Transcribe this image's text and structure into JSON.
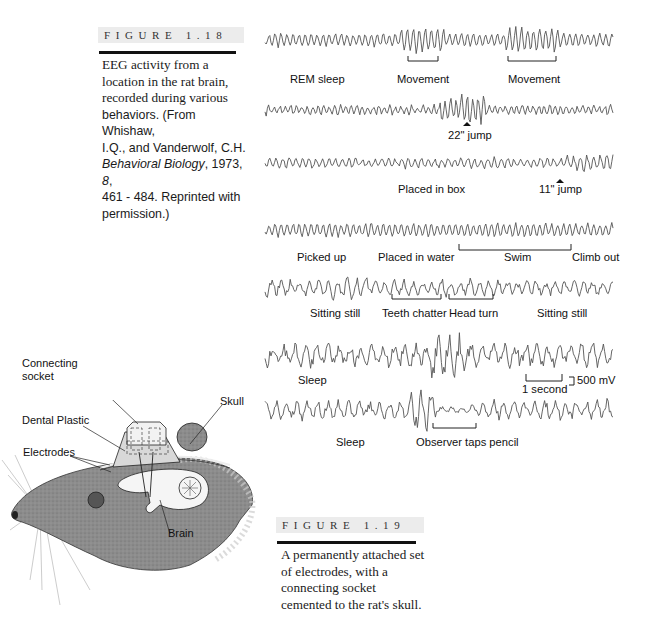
{
  "figure_1_18": {
    "label": "FIGURE 1.18",
    "caption_lines": [
      "EEG activity from a",
      "location in the rat brain,",
      "recorded during various"
    ],
    "caption_sans_1": "behaviors. (From Whishaw,",
    "caption_sans_2": "I.Q., and Vanderwolf, C.H.",
    "caption_italic_journal": "Behavioral Biology",
    "caption_after_journal": ", 1973, ",
    "caption_volume": "8",
    "caption_after_volume": ",",
    "caption_sans_4": "461 - 484. Reprinted with",
    "caption_sans_5": "permission.)"
  },
  "eeg_traces": [
    {
      "id": "rem",
      "labels": [
        {
          "text": "REM sleep",
          "x": 290,
          "y": 73
        },
        {
          "text": "Movement",
          "x": 397,
          "y": 73
        },
        {
          "text": "Movement",
          "x": 508,
          "y": 73
        }
      ],
      "brackets": [
        {
          "x1": 408,
          "x2": 438,
          "y": 61
        },
        {
          "x1": 508,
          "x2": 556,
          "y": 61
        }
      ]
    },
    {
      "id": "jump22",
      "labels": [
        {
          "text": "22\" jump",
          "x": 448,
          "y": 129
        }
      ],
      "markers": [
        {
          "x": 467,
          "y": 124
        }
      ]
    },
    {
      "id": "box",
      "labels": [
        {
          "text": "Placed in box",
          "x": 398,
          "y": 183
        },
        {
          "text": "11\" jump",
          "x": 539,
          "y": 183
        }
      ],
      "markers": [
        {
          "x": 560,
          "y": 181
        }
      ]
    },
    {
      "id": "water",
      "labels": [
        {
          "text": "Picked up",
          "x": 297,
          "y": 251
        },
        {
          "text": "Placed in water",
          "x": 378,
          "y": 251
        },
        {
          "text": "Swim",
          "x": 504,
          "y": 251
        },
        {
          "text": "Climb out",
          "x": 572,
          "y": 251
        }
      ],
      "brackets": [
        {
          "x1": 459,
          "x2": 571,
          "y": 250,
          "up": true
        }
      ]
    },
    {
      "id": "sitting",
      "labels": [
        {
          "text": "Sitting still",
          "x": 310,
          "y": 307
        },
        {
          "text": "Teeth chatter",
          "x": 382,
          "y": 307
        },
        {
          "text": "Head turn",
          "x": 449,
          "y": 307
        },
        {
          "text": "Sitting still",
          "x": 537,
          "y": 307
        }
      ],
      "brackets": [
        {
          "x1": 392,
          "x2": 441,
          "y": 299
        },
        {
          "x1": 449,
          "x2": 493,
          "y": 299
        }
      ]
    },
    {
      "id": "sleep1",
      "labels": [
        {
          "text": "Sleep",
          "x": 298,
          "y": 374
        }
      ]
    },
    {
      "id": "sleep2",
      "labels": [
        {
          "text": "Sleep",
          "x": 336,
          "y": 436
        },
        {
          "text": "Observer taps pencil",
          "x": 416,
          "y": 436
        }
      ],
      "brackets": [
        {
          "x1": 433,
          "x2": 476,
          "y": 428
        }
      ]
    }
  ],
  "scale_bar": {
    "time_label": "1 second",
    "voltage_label": "500 mV"
  },
  "figure_1_19": {
    "label": "FIGURE 1.19",
    "caption_lines": [
      "A permanently attached set",
      "of electrodes, with a",
      "connecting socket",
      "cemented to the rat's skull."
    ]
  },
  "diagram_labels": {
    "connecting_socket_1": "Connecting",
    "connecting_socket_2": "socket",
    "dental_plastic": "Dental Plastic",
    "electrodes": "Electrodes",
    "skull": "Skull",
    "brain": "Brain"
  },
  "colors": {
    "header_bg": "#ececec",
    "rule": "#111111",
    "trace": "#555555",
    "rat_fill": "#8c8c8c"
  }
}
